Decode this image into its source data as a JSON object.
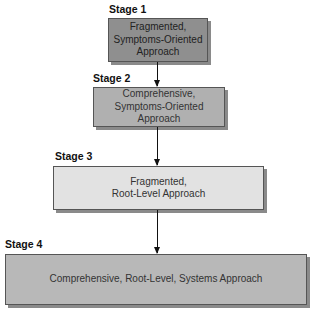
{
  "diagram": {
    "stages": [
      {
        "label": "Stage 1",
        "text": "Fragmented,\nSymptoms-Oriented\nApproach",
        "fill": "#8f8f8f"
      },
      {
        "label": "Stage 2",
        "text": "Comprehensive,\nSymptoms-Oriented\nApproach",
        "fill": "#b0b0b0"
      },
      {
        "label": "Stage 3",
        "text": "Fragmented,\nRoot-Level Approach",
        "fill": "#e2e2e2"
      },
      {
        "label": "Stage 4",
        "text": "Comprehensive, Root-Level, Systems Approach",
        "fill": "#b8b8b8"
      }
    ]
  }
}
